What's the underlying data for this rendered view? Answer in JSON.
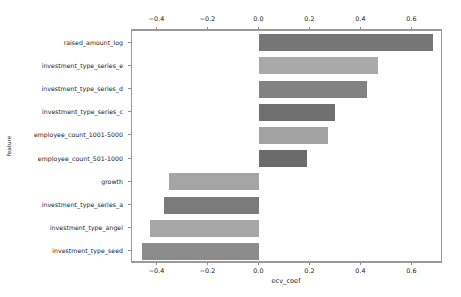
{
  "chart_data": {
    "type": "bar",
    "orientation": "horizontal",
    "title": "",
    "xlabel": "ecv_coef",
    "ylabel": "feature",
    "categories": [
      "raised_amount_log",
      "investment_type_series_e",
      "investment_type_series_d",
      "investment_type_series_c",
      "employee_count_1001-5000",
      "employee_count_501-1000",
      "growth",
      "investment_type_series_a",
      "investment_type_angel",
      "investment_type_seed"
    ],
    "values": [
      0.68,
      0.465,
      0.42,
      0.295,
      0.27,
      0.185,
      -0.355,
      -0.375,
      -0.43,
      -0.46
    ],
    "bar_colors": [
      "#777777",
      "#a9a9a9",
      "#828282",
      "#6f6f6f",
      "#a3a3a3",
      "#6b6b6b",
      "#a5a5a5",
      "#7a7a7a",
      "#a7a7a7",
      "#8c8c8c"
    ],
    "xlim": [
      -0.5,
      0.72
    ],
    "xticks": [
      -0.4,
      -0.2,
      0.0,
      0.2,
      0.4,
      0.6
    ],
    "xtick_labels": [
      "−0.4",
      "−0.2",
      "0.0",
      "0.2",
      "0.4",
      "0.6"
    ],
    "grid": false,
    "legend": null,
    "axes": {
      "top_axis_visible": true,
      "bottom_axis_visible": true,
      "frame_color": "#9a9a9a"
    }
  }
}
